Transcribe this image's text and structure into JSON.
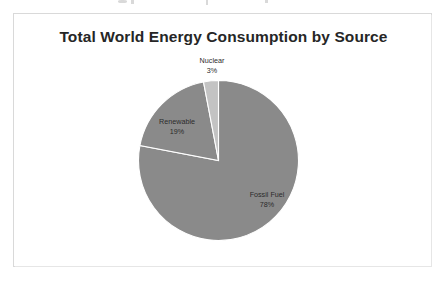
{
  "chart": {
    "title": "Total World Energy Consumption by Source",
    "frame_color": "#d9d9d9",
    "background": "#ffffff"
  },
  "chart_data": {
    "type": "pie",
    "title": "Total World Energy Consumption by Source",
    "xlabel": "",
    "ylabel": "",
    "legend_position": "none",
    "labels_inline": true,
    "categories": [
      "Fossil Fuel",
      "Renewable",
      "Nuclear"
    ],
    "values": [
      78,
      19,
      3
    ],
    "unit": "%",
    "colors": [
      "#8a8a8a",
      "#8a8a8a",
      "#c3c3c3"
    ],
    "slice_separator_color": "#ffffff",
    "start_angle_deg": 0,
    "direction": "clockwise",
    "slices": [
      {
        "name": "Fossil Fuel",
        "label": "Fossil Fuel",
        "percent_label": "78%",
        "value": 78,
        "color": "#8a8a8a"
      },
      {
        "name": "Renewable",
        "label": "Renewable",
        "percent_label": "19%",
        "value": 19,
        "color": "#8a8a8a"
      },
      {
        "name": "Nuclear",
        "label": "Nuclear",
        "percent_label": "3%",
        "value": 3,
        "color": "#c3c3c3"
      }
    ]
  }
}
